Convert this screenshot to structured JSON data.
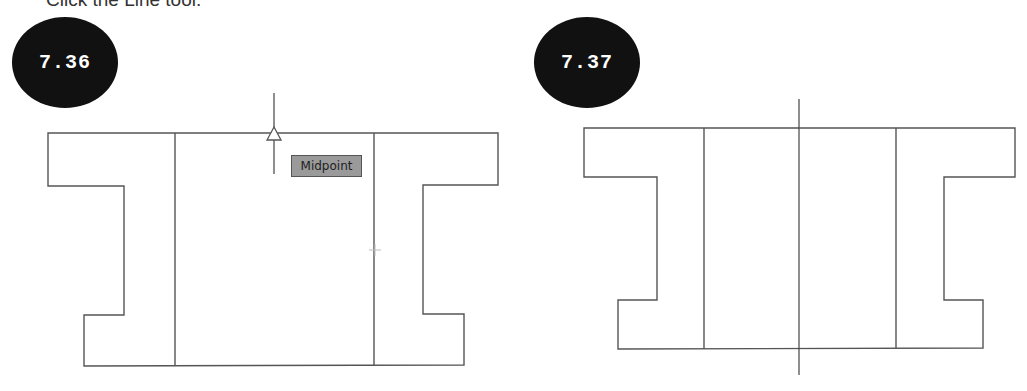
{
  "caption": {
    "text": "Click the Line tool."
  },
  "figures": [
    {
      "id": "left",
      "badge_label": "7.36",
      "tooltip_label": "Midpoint",
      "shape": {
        "description": "I-beam cross-section outline with two vertical interior lines",
        "outline_points": [
          [
            48,
            133
          ],
          [
            498,
            133
          ],
          [
            498,
            185
          ],
          [
            423,
            185
          ],
          [
            423,
            314
          ],
          [
            464,
            314
          ],
          [
            464,
            365
          ],
          [
            84,
            366
          ],
          [
            84,
            315
          ],
          [
            124,
            315
          ],
          [
            124,
            186
          ],
          [
            48,
            186
          ]
        ],
        "interior_lines": [
          [
            [
              175,
              133
            ],
            [
              175,
              366
            ]
          ],
          [
            [
              374,
              133
            ],
            [
              374,
              365
            ]
          ]
        ]
      },
      "cursor": {
        "type": "crosshair-vertical",
        "line": [
          [
            274,
            93
          ],
          [
            274,
            174
          ]
        ],
        "snap_marker": "midpoint-triangle",
        "snap_point": [
          274,
          133
        ]
      },
      "small_crosshair": [
        375,
        250
      ]
    },
    {
      "id": "right",
      "badge_label": "7.37",
      "shape": {
        "description": "I-beam cross-section outline with two vertical interior lines and a center line",
        "outline_points": [
          [
            584,
            128
          ],
          [
            1015,
            128
          ],
          [
            1015,
            177
          ],
          [
            944,
            177
          ],
          [
            944,
            300
          ],
          [
            983,
            300
          ],
          [
            983,
            348
          ],
          [
            618,
            349
          ],
          [
            618,
            300
          ],
          [
            657,
            300
          ],
          [
            657,
            177
          ],
          [
            584,
            177
          ]
        ],
        "interior_lines": [
          [
            [
              704,
              128
            ],
            [
              704,
              349
            ]
          ],
          [
            [
              896,
              128
            ],
            [
              896,
              348
            ]
          ]
        ],
        "center_line": [
          [
            799,
            99
          ],
          [
            799,
            375
          ]
        ]
      }
    }
  ],
  "colors": {
    "badge_fill": "#111111",
    "badge_text": "#ffffff",
    "line": "#555555",
    "tooltip_fill": "#9a9a9a",
    "tooltip_border": "#555555"
  }
}
